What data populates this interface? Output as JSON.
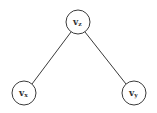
{
  "diagram": {
    "type": "tree",
    "colors": {
      "stroke": "#3a3a3a",
      "fill": "#ffffff",
      "text": "#333333"
    },
    "nodes": [
      {
        "id": "vz",
        "label": "v",
        "subscript": "z",
        "cx": 78,
        "cy": 22,
        "r": 12
      },
      {
        "id": "vx",
        "label": "v",
        "subscript": "x",
        "cx": 24,
        "cy": 93,
        "r": 12
      },
      {
        "id": "vy",
        "label": "v",
        "subscript": "y",
        "cx": 134,
        "cy": 93,
        "r": 12
      }
    ],
    "edges": [
      {
        "from": "vz",
        "to": "vx"
      },
      {
        "from": "vz",
        "to": "vy"
      }
    ]
  }
}
